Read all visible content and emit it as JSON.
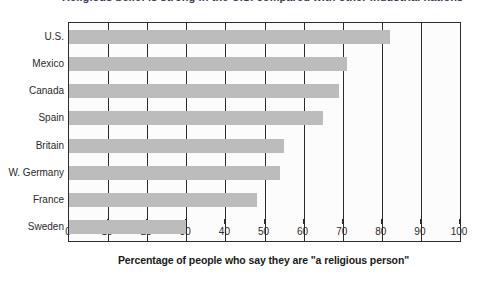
{
  "top_clipped_text": "Religious belief is strong in the U.S. compared with other industrial nations",
  "chart_data": {
    "type": "bar",
    "orientation": "horizontal",
    "title": "",
    "xlabel": "Percentage of people who say they are \"a religious person\"",
    "ylabel": "",
    "categories": [
      "U.S.",
      "Mexico",
      "Canada",
      "Spain",
      "Britain",
      "W. Germany",
      "France",
      "Sweden"
    ],
    "values": [
      82,
      71,
      69,
      65,
      55,
      54,
      48,
      30
    ],
    "xlim": [
      0,
      100
    ],
    "xticks": [
      0,
      10,
      20,
      30,
      40,
      50,
      60,
      70,
      80,
      90,
      100
    ],
    "xticklabels": [
      "0",
      "10",
      "20",
      "30",
      "40",
      "50",
      "60",
      "70",
      "80",
      "90",
      "100"
    ],
    "grid": "vertical",
    "legend": "none",
    "bar_color": "#bcbcbc",
    "gridline_color": "#2b2b2b",
    "plot_background": "#fcfcfc"
  }
}
